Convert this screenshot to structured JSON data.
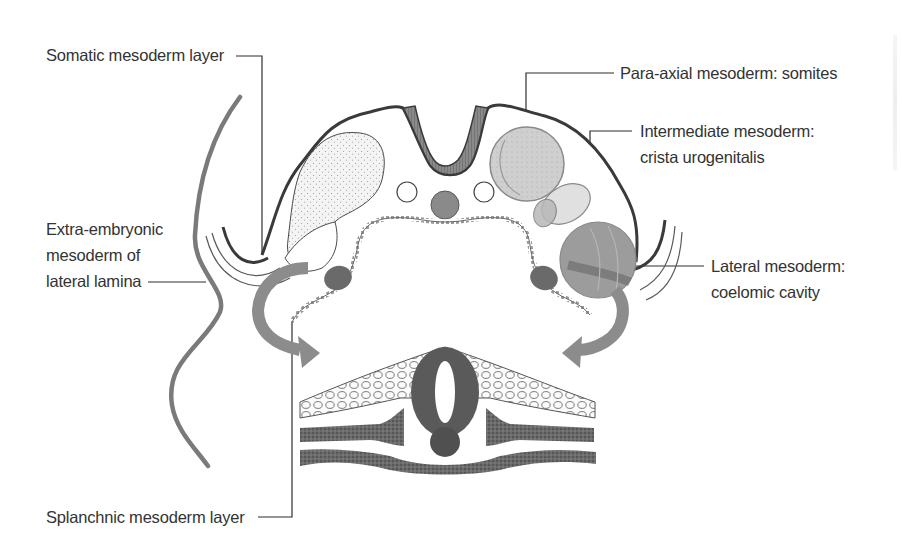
{
  "diagram": {
    "labels": {
      "somatic": "Somatic mesoderm layer",
      "extra_embryonic": [
        "Extra-embryonic",
        "mesoderm of",
        "lateral lamina"
      ],
      "splanchnic": "Splanchnic mesoderm layer",
      "para_axial": "Para-axial mesoderm: somites",
      "intermediate": [
        "Intermediate mesoderm:",
        "crista urogenitalis"
      ],
      "lateral": [
        "Lateral mesoderm:",
        "coelomic cavity"
      ]
    },
    "colors": {
      "outline": "#3a3a3a",
      "text": "#333333",
      "amnion_curve": "#7a7a7a",
      "arrow": "#8c8c8c",
      "neural_tube": "#7c7c7c",
      "notochord": "#8a8a8a",
      "somite_fill": "#cfcfcf",
      "intermediate_fill": "#dedede",
      "lateral_fill": "#9a9a9a",
      "aorta_fill": "#6a6a6a",
      "histology_dark": "#555555",
      "stipple_fill": "#f2f2f2"
    }
  }
}
